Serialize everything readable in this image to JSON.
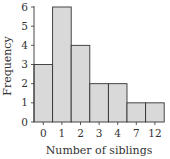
{
  "chart_data": {
    "type": "bar",
    "title": "",
    "categories": [
      "0",
      "1",
      "2",
      "3",
      "4",
      "7",
      "12"
    ],
    "values": [
      3,
      6,
      4,
      2,
      2,
      1,
      1
    ],
    "xlabel": "Number of siblings",
    "ylabel": "Frequency",
    "ylim": [
      0,
      6
    ],
    "yticks": [
      0,
      1,
      2,
      3,
      4,
      5,
      6
    ],
    "grid": false,
    "legend": null,
    "bar_color": "#d9d9d9",
    "edge_color": "#333333"
  }
}
